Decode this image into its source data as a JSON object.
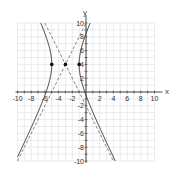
{
  "chart_data": {
    "type": "line",
    "title": "",
    "xlabel": "x",
    "ylabel": "y",
    "xlim": [
      -10,
      10
    ],
    "ylim": [
      -10,
      10
    ],
    "grid": true,
    "x_ticks": [
      -10,
      -8,
      -6,
      -4,
      -2,
      2,
      4,
      6,
      8,
      10
    ],
    "y_ticks": [
      -10,
      -8,
      -6,
      -4,
      -2,
      2,
      4,
      6,
      8,
      10
    ],
    "x_tick_labels": [
      "-10",
      "-8",
      "-6",
      "-4",
      "-2",
      "2",
      "4",
      "6",
      "8",
      "10"
    ],
    "y_tick_labels": [
      "-10",
      "-8",
      "-6",
      "-4",
      "-2",
      "2",
      "4",
      "6",
      "8",
      "10"
    ],
    "equation": "(x+3)^2/4 - (y-4)^2/16 = 1",
    "hyperbola": {
      "h": -3,
      "k": 4,
      "a": 2,
      "b": 4,
      "orientation": "horizontal"
    },
    "asymptotes": [
      {
        "slope": 2,
        "intercept": 10,
        "style": "dashed"
      },
      {
        "slope": -2,
        "intercept": -2,
        "style": "dashed"
      }
    ],
    "points": [
      {
        "x": -5,
        "y": 4,
        "label": "vertex"
      },
      {
        "x": -3,
        "y": 4,
        "label": "center"
      },
      {
        "x": -1,
        "y": 4,
        "label": "vertex"
      }
    ],
    "colors": {
      "curve": "#333333",
      "asymptote": "#666666",
      "grid": "#dddddd",
      "axis": "#333333",
      "point": "#111111"
    }
  }
}
